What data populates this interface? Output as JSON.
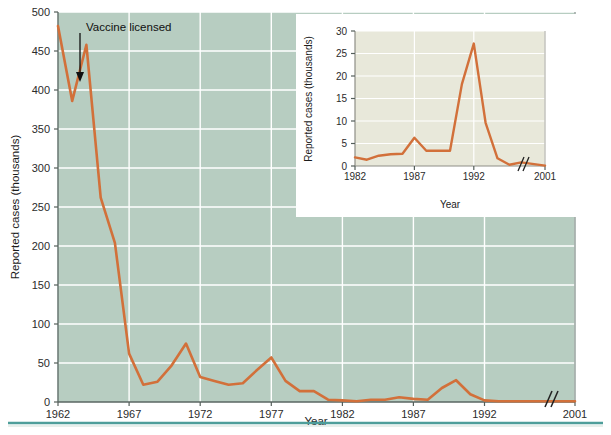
{
  "figure": {
    "background_color": "#ffffff",
    "rule_color": "#4e9e9a",
    "annotation": {
      "label": "Vaccine licensed",
      "arrow_name": "annotation-arrow",
      "year": 1963,
      "value": 410
    }
  },
  "chart_data": [
    {
      "id": "main",
      "type": "line",
      "title": "",
      "xlabel": "Year",
      "ylabel": "Reported cases (thousands)",
      "xlim": [
        1962,
        2001
      ],
      "ylim": [
        0,
        500
      ],
      "grid": true,
      "grid_color": "#ffffff",
      "plot_background": "#b7cdc1",
      "line_color": "#d2703a",
      "axis_break": {
        "present": true,
        "after_year": 1996,
        "label": "//"
      },
      "xticks": [
        1962,
        1967,
        1972,
        1977,
        1982,
        1987,
        1992,
        2001
      ],
      "xtick_labels": [
        "1962",
        "1967",
        "1972",
        "1977",
        "1982",
        "1987",
        "1992",
        "2001"
      ],
      "yticks": [
        0,
        50,
        100,
        150,
        200,
        250,
        300,
        350,
        400,
        450,
        500
      ],
      "ytick_labels": [
        "0",
        "50",
        "100",
        "150",
        "200",
        "250",
        "300",
        "350",
        "400",
        "450",
        "500"
      ],
      "x": [
        1962,
        1963,
        1964,
        1965,
        1966,
        1967,
        1968,
        1969,
        1970,
        1971,
        1972,
        1973,
        1974,
        1975,
        1976,
        1977,
        1978,
        1979,
        1980,
        1981,
        1982,
        1983,
        1984,
        1985,
        1986,
        1987,
        1988,
        1989,
        1990,
        1991,
        1992,
        1993,
        1994,
        1995,
        1996,
        2001
      ],
      "values": [
        482,
        386,
        458,
        262,
        204,
        62,
        22,
        26,
        47,
        75,
        32,
        27,
        22,
        24,
        41,
        57,
        27,
        14,
        14,
        3,
        2,
        1,
        3,
        3,
        6,
        4,
        3,
        18,
        28,
        10,
        2,
        1,
        1,
        1,
        1,
        1
      ]
    },
    {
      "id": "inset",
      "type": "line",
      "title": "",
      "xlabel": "Year",
      "ylabel": "Reported cases (thousands)",
      "xlim": [
        1982,
        2001
      ],
      "ylim": [
        0,
        30
      ],
      "grid": true,
      "grid_color": "#ffffff",
      "plot_background": "#e8e8da",
      "line_color": "#d2703a",
      "axis_break": {
        "present": true,
        "after_year": 1996,
        "label": "//"
      },
      "xticks": [
        1982,
        1987,
        1992,
        2001
      ],
      "xtick_labels": [
        "1982",
        "1987",
        "1992",
        "2001"
      ],
      "yticks": [
        0,
        5,
        10,
        15,
        20,
        25,
        30
      ],
      "ytick_labels": [
        "0",
        "5",
        "10",
        "15",
        "20",
        "25",
        "30"
      ],
      "x": [
        1982,
        1983,
        1984,
        1985,
        1986,
        1987,
        1988,
        1989,
        1990,
        1991,
        1992,
        1993,
        1994,
        1995,
        1996,
        2001
      ],
      "values": [
        1.9,
        1.4,
        2.3,
        2.6,
        2.7,
        6.3,
        3.4,
        3.4,
        3.4,
        18.2,
        27.2,
        9.6,
        1.7,
        0.3,
        0.8,
        0.1
      ]
    }
  ]
}
